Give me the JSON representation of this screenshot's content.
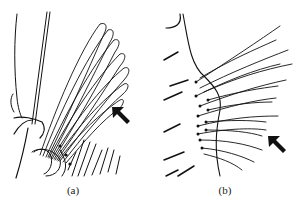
{
  "figure": {
    "panels": [
      {
        "id": "a",
        "label": "(a)",
        "subject": "fan of plumose setae with arrow indicator"
      },
      {
        "id": "b",
        "label": "(b)",
        "subject": "row of fine setae along a curved margin with arrow indicator"
      }
    ],
    "arrow_direction": "up-left",
    "colors": {
      "ink": "#111111",
      "background": "#ffffff"
    }
  }
}
